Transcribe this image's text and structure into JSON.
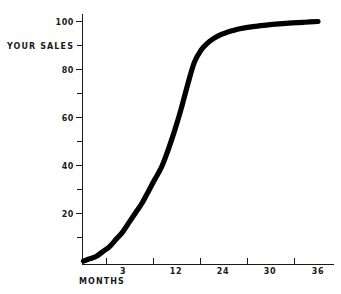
{
  "chart_data": {
    "type": "line",
    "title": "",
    "subtitle": "",
    "xlabel": "MONTHS",
    "ylabel": "YOUR SALES",
    "xlim": [
      0,
      36
    ],
    "ylim": [
      0,
      104
    ],
    "grid": false,
    "legend": null,
    "x_tick_labels": [
      "3",
      "12",
      "24",
      "30",
      "36"
    ],
    "x_tick_values": [
      3,
      12,
      24,
      30,
      36
    ],
    "x_minor_tick_values": [
      1.5,
      7.5,
      18,
      27,
      33
    ],
    "y_tick_labels": [
      "20",
      "40",
      "60",
      "80",
      "100"
    ],
    "y_tick_values": [
      20,
      40,
      60,
      80,
      100
    ],
    "y_minor_tick_values": [
      10,
      30,
      50,
      70,
      90
    ],
    "series": [
      {
        "name": "Your Sales",
        "color": "#000000",
        "x": [
          0,
          1,
          2,
          3,
          4,
          5,
          6,
          7,
          8,
          9,
          10,
          11,
          12,
          13,
          14,
          15,
          16,
          17,
          18,
          19,
          20,
          21,
          22,
          23,
          24,
          26,
          28,
          30,
          32,
          34,
          36
        ],
        "values": [
          1,
          2,
          3,
          5,
          7,
          10,
          13,
          17,
          21,
          25,
          30,
          35,
          40,
          47,
          55,
          64,
          74,
          83,
          88,
          91,
          93,
          94.5,
          95.5,
          96.3,
          97,
          97.9,
          98.5,
          99,
          99.4,
          99.7,
          100
        ]
      }
    ]
  },
  "axis": {
    "y_label_text": "YOUR SALES",
    "x_label_text": "MONTHS"
  },
  "colors": {
    "curve": "#000000",
    "axis": "#1a1a1a",
    "text": "#1a1a1a",
    "background": "#ffffff"
  }
}
